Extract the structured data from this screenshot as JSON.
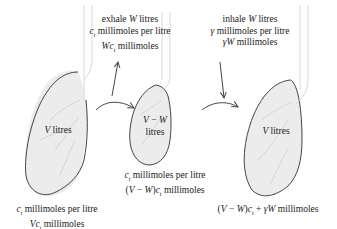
{
  "exhale": {
    "line1": "exhale W litres",
    "line2": "c_t millimoles per litre",
    "line3": "Wc_t millimoles"
  },
  "inhale": {
    "line1": "inhale W litres",
    "line2": "γ millimoles per litre",
    "line3": "γW millimoles"
  },
  "lung_left": {
    "label": "V litres",
    "caption1": "c_t millimoles per litre",
    "caption2": "Vc_t millimoles"
  },
  "lung_middle": {
    "label1": "V − W",
    "label2": "litres",
    "caption1": "c_t millimoles per litre",
    "caption2": "(V − W)c_t millimoles"
  },
  "lung_right": {
    "label": "V litres",
    "caption1": "(V − W)c_t + γW millimoles"
  },
  "colors": {
    "lung_fill": "#ececec",
    "outline": "#444444",
    "airway": "#d8d8d8"
  }
}
